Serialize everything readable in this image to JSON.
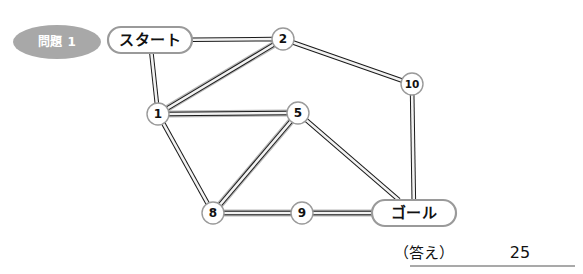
{
  "page": {
    "width": 583,
    "height": 274,
    "background": "#ffffff"
  },
  "badge": {
    "label": "問題 1",
    "fill": "#a8a8a8",
    "text_color": "#ffffff",
    "cx": 57,
    "cy": 42,
    "rx": 44,
    "ry": 17
  },
  "colors": {
    "edge_outline": "#1a1a1a",
    "edge_fill": "#f2f2f2",
    "edge_highlight": "#b5b5b5",
    "node_stroke": "#9a9a9a",
    "node_fill": "#ffffff",
    "text": "#111111",
    "rule": "#555555"
  },
  "graph": {
    "nodes": [
      {
        "id": "start",
        "label": "スタート",
        "shape": "pill",
        "x": 150,
        "y": 40,
        "w": 84,
        "h": 26
      },
      {
        "id": "n2",
        "label": "2",
        "shape": "circle",
        "x": 283,
        "y": 39,
        "r": 11
      },
      {
        "id": "n10",
        "label": "10",
        "shape": "circle",
        "x": 412,
        "y": 84,
        "r": 11
      },
      {
        "id": "n1",
        "label": "1",
        "shape": "circle",
        "x": 158,
        "y": 114,
        "r": 11
      },
      {
        "id": "n5",
        "label": "5",
        "shape": "circle",
        "x": 298,
        "y": 113,
        "r": 11
      },
      {
        "id": "n8",
        "label": "8",
        "shape": "circle",
        "x": 213,
        "y": 213,
        "r": 11
      },
      {
        "id": "n9",
        "label": "9",
        "shape": "circle",
        "x": 302,
        "y": 213,
        "r": 11
      },
      {
        "id": "goal",
        "label": "ゴール",
        "shape": "pill",
        "x": 414,
        "y": 213,
        "w": 84,
        "h": 26
      }
    ],
    "edges": [
      {
        "from": "start",
        "to": "n2",
        "highlight": false
      },
      {
        "from": "start",
        "to": "n1",
        "highlight": false
      },
      {
        "from": "n1",
        "to": "n2",
        "highlight": true
      },
      {
        "from": "n2",
        "to": "n10",
        "highlight": false
      },
      {
        "from": "n10",
        "to": "goal",
        "highlight": false
      },
      {
        "from": "n1",
        "to": "n5",
        "highlight": true
      },
      {
        "from": "n1",
        "to": "n8",
        "highlight": false
      },
      {
        "from": "n5",
        "to": "n8",
        "highlight": true
      },
      {
        "from": "n5",
        "to": "goal",
        "highlight": false
      },
      {
        "from": "n8",
        "to": "n9",
        "highlight": true
      },
      {
        "from": "n9",
        "to": "goal",
        "highlight": true
      }
    ]
  },
  "answer": {
    "label": "（答え）",
    "value": "25",
    "label_x": 424,
    "value_x": 520,
    "y": 258,
    "rule": {
      "x1": 410,
      "x2": 575,
      "y": 266
    }
  }
}
